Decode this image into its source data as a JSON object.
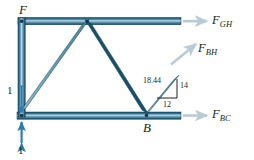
{
  "figure": {
    "type": "truss-free-body-diagram",
    "background_color": "#ffffff",
    "member_color_dark": "#17506b",
    "member_color_light": "#9fc3d4",
    "arrow_color": "#b9ccd6",
    "load_arrow_color": "#2a7fae",
    "text_color": "#231f20"
  },
  "joints": [
    {
      "name": "F",
      "label": "F"
    },
    {
      "name": "B",
      "label": "B"
    }
  ],
  "forces": [
    {
      "name": "F_GH",
      "base": "F",
      "sub": "GH",
      "direction": "right"
    },
    {
      "name": "F_BH",
      "base": "F",
      "sub": "BH",
      "direction": "up-right"
    },
    {
      "name": "F_BC",
      "base": "F",
      "sub": "BC",
      "direction": "right"
    }
  ],
  "slope_triangle": {
    "hypotenuse": "18.44",
    "vertical": "14",
    "horizontal": "12"
  },
  "scale_marks": [
    {
      "name": "upper-unit",
      "label": "1"
    },
    {
      "name": "lower-unit",
      "label": "1"
    }
  ]
}
